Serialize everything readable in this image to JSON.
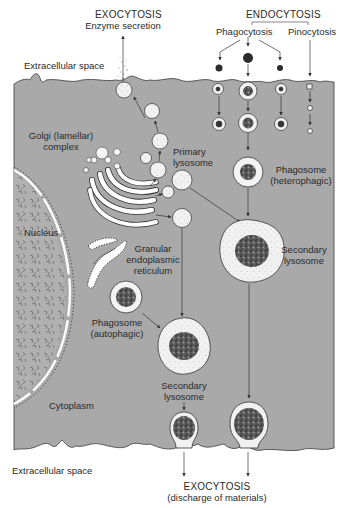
{
  "diagram": {
    "colors": {
      "cytoplasm": "#a9a9a9",
      "nucleus": "#b3b3b3",
      "membrane_outline": "#3a3a3a",
      "vesicle_fill": "#f2f2f2",
      "background": "#ffffff",
      "arrow": "#3a3a3a"
    },
    "labels": {
      "exocytosis_top": "EXOCYTOSIS",
      "enzyme_secretion": "Enzyme secretion",
      "endocytosis": "ENDOCYTOSIS",
      "phagocytosis": "Phagocytosis",
      "pinocytosis": "Pinocytosis",
      "extracellular_top": "Extracellular space",
      "golgi_line1": "Golgi (lamellar)",
      "golgi_line2": "complex",
      "primary_lysosome_line1": "Primary",
      "primary_lysosome_line2": "lysosome",
      "phagosome_hetero_line1": "Phagosome",
      "phagosome_hetero_line2": "(heterophagic)",
      "nucleus": "Nucleus",
      "secondary_lysosome_right_line1": "Secondary",
      "secondary_lysosome_right_line2": "lysosome",
      "granular_er_line1": "Granular",
      "granular_er_line2": "endoplasmic",
      "granular_er_line3": "reticulum",
      "phagosome_auto_line1": "Phagosome",
      "phagosome_auto_line2": "(autophagic)",
      "secondary_lysosome_mid_line1": "Secondary",
      "secondary_lysosome_mid_line2": "lysosome",
      "cytoplasm": "Cytoplasm",
      "extracellular_bottom": "Extracellular space",
      "exocytosis_bottom": "EXOCYTOSIS",
      "discharge": "(discharge of materials)"
    }
  }
}
